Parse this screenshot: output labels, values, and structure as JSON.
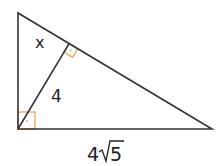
{
  "diagram": {
    "type": "right-triangle-with-altitude",
    "vertices": {
      "top": [
        18,
        13
      ],
      "right_angle": [
        18,
        129
      ],
      "right": [
        212,
        129
      ],
      "altitude_foot": [
        69,
        44
      ]
    },
    "labels": {
      "x": "x",
      "altitude": "4",
      "base_coef": "4",
      "base_radicand": "5"
    },
    "colors": {
      "line": "#333333",
      "right_angle_mark": "#E8A35E"
    }
  }
}
